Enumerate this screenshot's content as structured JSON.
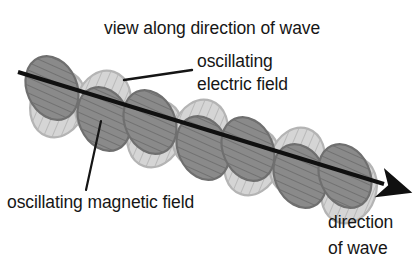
{
  "diagram": {
    "title": "view along direction of wave",
    "labels": {
      "electric_line1": "oscillating",
      "electric_line2": "electric field",
      "magnetic": "oscillating magnetic field",
      "direction_line1": "direction",
      "direction_line2": "of wave"
    },
    "colors": {
      "background": "#ffffff",
      "text": "#161616",
      "axis_line": "#101010",
      "dark_lobe_fill": "#8a8a8a",
      "dark_lobe_stroke": "#6f6f6f",
      "dark_lobe_hatch": "#6a6a6a",
      "light_lobe_fill": "#d5d5d5",
      "light_lobe_stroke": "#b4b4b4",
      "light_lobe_hatch": "#b0b0b0",
      "leader_line": "#151515"
    },
    "axis": {
      "start_x": 18,
      "start_y": 72,
      "end_x": 388,
      "end_y": 186,
      "arrowhead": "arrow-right-down",
      "stroke_width": 4
    },
    "leaders": [
      {
        "name": "electric-field-leader",
        "x1": 124,
        "y1": 80,
        "x2": 192,
        "y2": 70
      },
      {
        "name": "magnetic-field-leader",
        "x1": 101,
        "y1": 121,
        "x2": 86,
        "y2": 190
      }
    ],
    "lobes": {
      "count": 14,
      "dark_label": "oscillating magnetic field lobe",
      "light_label": "oscillating electric field lobe",
      "dark_hatch": "diagonal",
      "light_hatch": "vertical",
      "centers": [
        {
          "x": 52,
          "y": 88,
          "type": "dark"
        },
        {
          "x": 58,
          "y": 104,
          "type": "light"
        },
        {
          "x": 103,
          "y": 104,
          "type": "light"
        },
        {
          "x": 104,
          "y": 119,
          "type": "dark"
        },
        {
          "x": 150,
          "y": 122,
          "type": "dark"
        },
        {
          "x": 155,
          "y": 134,
          "type": "light"
        },
        {
          "x": 200,
          "y": 133,
          "type": "light"
        },
        {
          "x": 203,
          "y": 148,
          "type": "dark"
        },
        {
          "x": 248,
          "y": 149,
          "type": "dark"
        },
        {
          "x": 252,
          "y": 162,
          "type": "light"
        },
        {
          "x": 297,
          "y": 161,
          "type": "light"
        },
        {
          "x": 300,
          "y": 176,
          "type": "dark"
        },
        {
          "x": 345,
          "y": 176,
          "type": "dark"
        },
        {
          "x": 349,
          "y": 190,
          "type": "light"
        }
      ]
    }
  }
}
